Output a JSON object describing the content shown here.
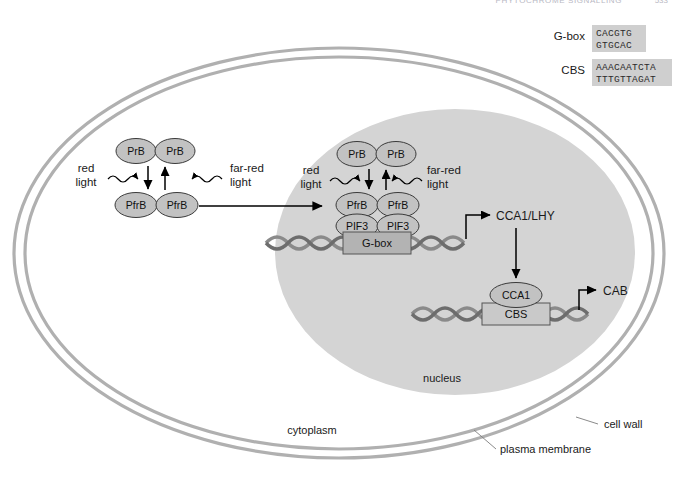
{
  "header": {
    "running_head": "PHYTOCHROME SIGNALLING",
    "page_number": "533"
  },
  "legend": {
    "items": [
      {
        "name": "G-box",
        "label": "G-box",
        "top_strand": "CACGTG",
        "bottom_strand": "GTGCAC"
      },
      {
        "name": "CBS",
        "label": "CBS",
        "top_strand": "AAACAATCTA",
        "bottom_strand": "TTTGTTAGAT"
      }
    ]
  },
  "compartments": {
    "cell_wall": "cell wall",
    "plasma_membrane": "plasma membrane",
    "cytoplasm": "cytoplasm",
    "nucleus": "nucleus"
  },
  "cytoplasm_module": {
    "pr_dimer": [
      "PrB",
      "PrB"
    ],
    "pfr_dimer": [
      "PfrB",
      "PfrB"
    ],
    "red_light": [
      "red",
      "light"
    ],
    "far_red_light": [
      "far-red",
      "light"
    ]
  },
  "nucleus_module": {
    "pr_dimer": [
      "PrB",
      "PrB"
    ],
    "pfr_dimer": [
      "PfrB",
      "PfrB"
    ],
    "pif3_dimer": [
      "PIF3",
      "PIF3"
    ],
    "red_light": [
      "red",
      "light"
    ],
    "far_red_light": [
      "far-red",
      "light"
    ],
    "promoter_element": "G-box",
    "gene_product": "CCA1/LHY"
  },
  "output_module": {
    "transcription_factor": "CCA1",
    "promoter_element": "CBS",
    "gene_product": "CAB"
  },
  "colors": {
    "wall_stroke": "#b0b0b0",
    "nucleus_fill": "#d4d4d4",
    "oval_fill": "#c2c2c2",
    "oval_stroke": "#3a3a3a",
    "box_fill": "#b3b3b3",
    "box_fill_light": "#c9c9c9",
    "box_stroke": "#555555",
    "dna_stroke": "#8a8a8a",
    "dna_stroke_dark": "#6d6d6d",
    "arrow": "#000000",
    "legend_fill": "#cfcfcf",
    "text": "#1a1a1a"
  }
}
